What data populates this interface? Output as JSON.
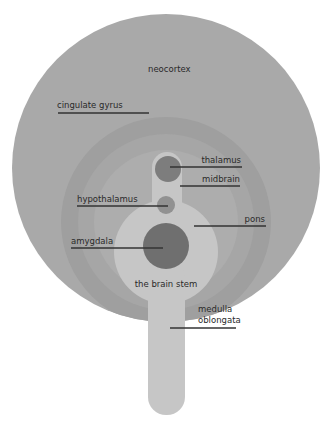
{
  "diagram": {
    "colors": {
      "neocortex": "#a9a9a9",
      "cingulate_ring": "#9f9f9f",
      "limbic_ring": "#a6a6a6",
      "inner_area": "#adadad",
      "brain_stem": "#c6c6c6",
      "thalamus": "#7d7d7d",
      "hypothalamus": "#919191",
      "amygdala": "#6f6f6f",
      "leader_line": "#333333",
      "background": "#ffffff"
    },
    "labels": {
      "neocortex": "neocortex",
      "cingulate_gyrus": "cingulate gyrus",
      "thalamus": "thalamus",
      "midbrain": "midbrain",
      "hypothalamus": "hypothalamus",
      "pons": "pons",
      "amygdala": "amygdala",
      "brain_stem": "the brain stem",
      "medulla_line1": "medulla",
      "medulla_line2": "oblongata"
    }
  }
}
